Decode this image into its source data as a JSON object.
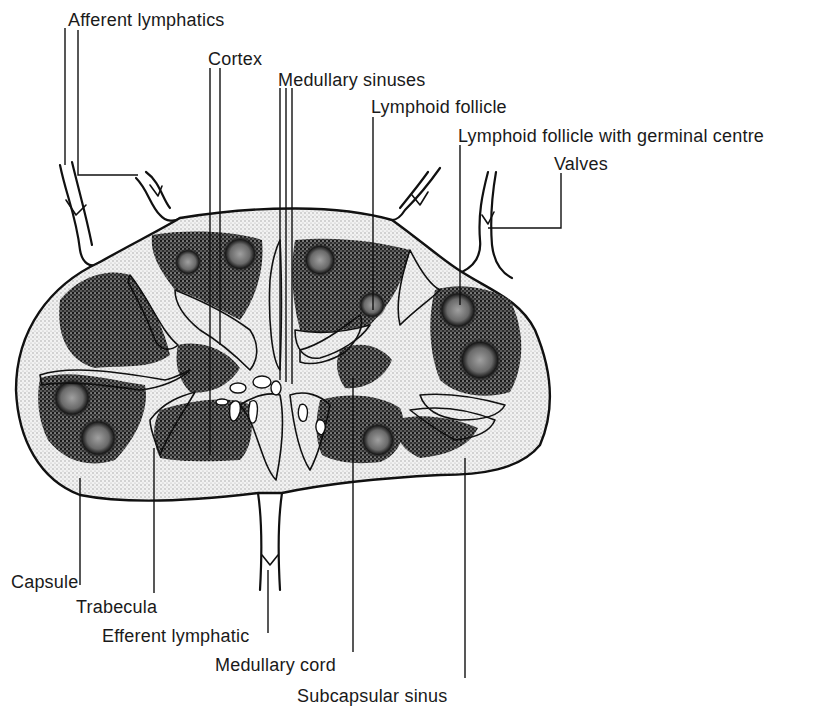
{
  "diagram": {
    "colors": {
      "background": "#ffffff",
      "ink": "#111111",
      "capsule_stipple": "#d9d9d9",
      "lymphoid_tissue": "#3a3a3a",
      "germinal_centre": "#8a8a8a"
    },
    "labels": {
      "afferent_lymphatics": "Afferent lymphatics",
      "cortex": "Cortex",
      "medullary_sinuses": "Medullary sinuses",
      "lymphoid_follicle": "Lymphoid follicle",
      "lymphoid_follicle_germinal": "Lymphoid follicle with germinal centre",
      "valves": "Valves",
      "capsule": "Capsule",
      "trabecula": "Trabecula",
      "efferent_lymphatic": "Efferent lymphatic",
      "medullary_cord": "Medullary cord",
      "subcapsular_sinus": "Subcapsular sinus"
    }
  }
}
